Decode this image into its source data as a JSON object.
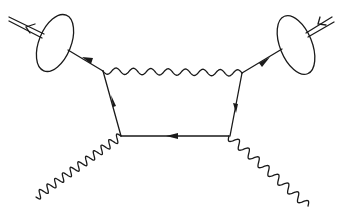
{
  "diagram": {
    "type": "feynman-diagram",
    "colors": {
      "ink": "#1a1a1a",
      "background": "#ffffff"
    },
    "elements": [
      {
        "name": "hadron-left",
        "kind": "blob",
        "incoming": "double-line-with-arrow"
      },
      {
        "name": "hadron-right",
        "kind": "blob",
        "incoming": "double-line-with-arrow"
      },
      {
        "name": "quark-left",
        "kind": "fermion-line",
        "from": "hadron-left",
        "to": "vertex-top-left"
      },
      {
        "name": "quark-right",
        "kind": "fermion-line",
        "from": "hadron-right",
        "to": "vertex-top-right"
      },
      {
        "name": "gluon-exchange",
        "kind": "wavy-line",
        "from": "vertex-top-left",
        "to": "vertex-top-right"
      },
      {
        "name": "box-left",
        "kind": "fermion-line",
        "from": "vertex-bottom-left",
        "to": "vertex-top-left"
      },
      {
        "name": "box-right",
        "kind": "fermion-line",
        "from": "vertex-top-right",
        "to": "vertex-bottom-right"
      },
      {
        "name": "box-bottom",
        "kind": "fermion-line",
        "from": "vertex-bottom-right",
        "to": "vertex-bottom-left"
      },
      {
        "name": "photon-left",
        "kind": "wavy-line",
        "from": "vertex-bottom-left",
        "to": "external"
      },
      {
        "name": "photon-right",
        "kind": "wavy-line",
        "from": "vertex-bottom-right",
        "to": "external"
      }
    ]
  }
}
